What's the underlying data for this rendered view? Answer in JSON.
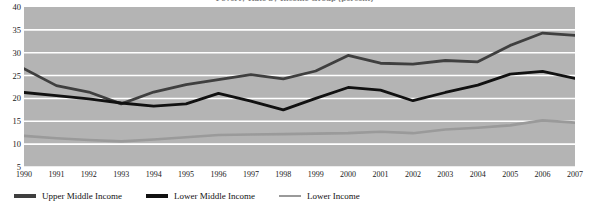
{
  "chart_data": {
    "type": "line",
    "title": "Poverty Rate by Income Group (percent)",
    "xlabel": "",
    "ylabel": "",
    "ylim": [
      5,
      40
    ],
    "yticks": [
      40,
      35,
      30,
      25,
      20,
      15,
      10,
      5
    ],
    "grid": true,
    "legend_position": "bottom-left",
    "background": "#b4b4b4",
    "gridline_color": "#ffffff",
    "categories": [
      "1990",
      "1991",
      "1992",
      "1993",
      "1994",
      "1995",
      "1996",
      "1997",
      "1998",
      "1999",
      "2000",
      "2001",
      "2002",
      "2003",
      "2004",
      "2005",
      "2006",
      "2007"
    ],
    "series": [
      {
        "name": "Upper Middle Income",
        "color": "#3f3f3f",
        "values": [
          26.5,
          22.8,
          21.4,
          18.8,
          21.4,
          23.0,
          24.1,
          25.2,
          24.3,
          26.0,
          29.4,
          27.7,
          27.5,
          28.3,
          28.0,
          31.6,
          34.3,
          33.8
        ]
      },
      {
        "name": "Lower Middle Income",
        "color": "#111111",
        "values": [
          21.3,
          20.6,
          19.9,
          19.0,
          18.3,
          18.8,
          21.1,
          19.4,
          17.5,
          20.0,
          22.4,
          21.8,
          19.5,
          21.3,
          22.9,
          25.3,
          25.9,
          24.4
        ]
      },
      {
        "name": "Lower Income",
        "color": "#9a9a9a",
        "values": [
          11.8,
          11.3,
          10.9,
          10.6,
          11.0,
          11.5,
          12.0,
          12.1,
          12.2,
          12.3,
          12.4,
          12.7,
          12.4,
          13.2,
          13.6,
          14.1,
          15.2,
          14.7
        ]
      }
    ]
  }
}
